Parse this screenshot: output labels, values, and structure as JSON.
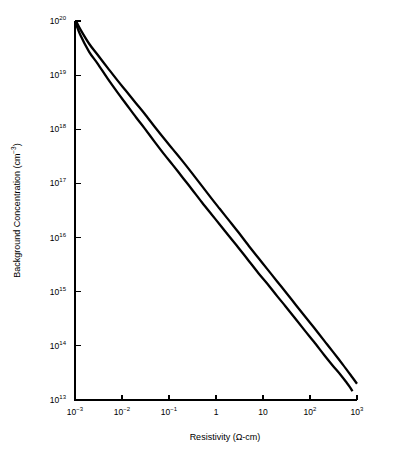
{
  "chart_data": {
    "type": "line",
    "title": "",
    "xlabel": "Resistivity (Ω-cm)",
    "ylabel": "Background Concentration (cm⁻³)",
    "xscale": "log",
    "yscale": "log",
    "xlim": [
      0.001,
      1000
    ],
    "ylim": [
      10000000000000.0,
      1e+20
    ],
    "grid": false,
    "legend": "none",
    "background_color": "#ffffff",
    "line_color": "#000000",
    "xticks": [
      {
        "value": 0.001,
        "mantissa": "10",
        "exponent": "−3",
        "label": "10⁻³"
      },
      {
        "value": 0.01,
        "mantissa": "10",
        "exponent": "−2",
        "label": "10⁻²"
      },
      {
        "value": 0.1,
        "mantissa": "10",
        "exponent": "−1",
        "label": "10⁻¹"
      },
      {
        "value": 1,
        "mantissa": "1",
        "exponent": "",
        "label": "1"
      },
      {
        "value": 10,
        "mantissa": "10",
        "exponent": "",
        "label": "10"
      },
      {
        "value": 100,
        "mantissa": "10",
        "exponent": "2",
        "label": "10²"
      },
      {
        "value": 1000,
        "mantissa": "10",
        "exponent": "3",
        "label": "10³"
      }
    ],
    "yticks": [
      {
        "value": 10000000000000.0,
        "mantissa": "10",
        "exponent": "13",
        "label": "10¹³"
      },
      {
        "value": 100000000000000.0,
        "mantissa": "10",
        "exponent": "14",
        "label": "10¹⁴"
      },
      {
        "value": 1000000000000000.0,
        "mantissa": "10",
        "exponent": "15",
        "label": "10¹⁵"
      },
      {
        "value": 1e+16,
        "mantissa": "10",
        "exponent": "16",
        "label": "10¹⁶"
      },
      {
        "value": 1e+17,
        "mantissa": "10",
        "exponent": "17",
        "label": "10¹⁷"
      },
      {
        "value": 1e+18,
        "mantissa": "10",
        "exponent": "18",
        "label": "10¹⁸"
      },
      {
        "value": 1e+19,
        "mantissa": "10",
        "exponent": "19",
        "label": "10¹⁹"
      },
      {
        "value": 1e+20,
        "mantissa": "10",
        "exponent": "20",
        "label": "10²⁰"
      }
    ],
    "series": [
      {
        "name": "upper-curve",
        "points": [
          [
            0.00105,
            1e+20
          ],
          [
            0.0013,
            7e+19
          ],
          [
            0.002,
            3.8e+19
          ],
          [
            0.003,
            2.4e+19
          ],
          [
            0.005,
            1.35e+19
          ],
          [
            0.008,
            8e+18
          ],
          [
            0.012,
            5.2e+18
          ],
          [
            0.02,
            3e+18
          ],
          [
            0.03,
            1.95e+18
          ],
          [
            0.05,
            1.1e+18
          ],
          [
            0.08,
            6.6e+17
          ],
          [
            0.12,
            4.3e+17
          ],
          [
            0.2,
            2.5e+17
          ],
          [
            0.3,
            1.6e+17
          ],
          [
            0.5,
            9e+16
          ],
          [
            0.8,
            5.3e+16
          ],
          [
            1.2,
            3.4e+16
          ],
          [
            2.0,
            1.95e+16
          ],
          [
            3.0,
            1.25e+16
          ],
          [
            5.0,
            7000000000000000.0
          ],
          [
            8.0,
            4200000000000000.0
          ],
          [
            12.0,
            2700000000000000.0
          ],
          [
            20.0,
            1550000000000000.0
          ],
          [
            30.0,
            1000000000000000.0
          ],
          [
            50.0,
            570000000000000.0
          ],
          [
            80.0,
            340000000000000.0
          ],
          [
            120.0,
            220000000000000.0
          ],
          [
            200.0,
            125000000000000.0
          ],
          [
            300.0,
            80000000000000.0
          ],
          [
            500.0,
            45000000000000.0
          ],
          [
            800.0,
            26000000000000.0
          ],
          [
            1000.0,
            20000000000000.0
          ]
        ]
      },
      {
        "name": "lower-curve",
        "points": [
          [
            0.001,
            1e+20
          ],
          [
            0.0013,
            5.5e+19
          ],
          [
            0.002,
            2.7e+19
          ],
          [
            0.003,
            1.65e+19
          ],
          [
            0.005,
            8.5e+18
          ],
          [
            0.008,
            4.8e+18
          ],
          [
            0.012,
            3e+18
          ],
          [
            0.02,
            1.65e+18
          ],
          [
            0.03,
            1.05e+18
          ],
          [
            0.05,
            5.8e+17
          ],
          [
            0.08,
            3.4e+17
          ],
          [
            0.12,
            2.2e+17
          ],
          [
            0.2,
            1.25e+17
          ],
          [
            0.3,
            8e+16
          ],
          [
            0.5,
            4.5e+16
          ],
          [
            0.8,
            2.7e+16
          ],
          [
            1.2,
            1.75e+16
          ],
          [
            2.0,
            1e+16
          ],
          [
            3.0,
            6500000000000000.0
          ],
          [
            5.0,
            3700000000000000.0
          ],
          [
            8.0,
            2200000000000000.0
          ],
          [
            12.0,
            1450000000000000.0
          ],
          [
            20.0,
            830000000000000.0
          ],
          [
            30.0,
            540000000000000.0
          ],
          [
            50.0,
            310000000000000.0
          ],
          [
            80.0,
            185000000000000.0
          ],
          [
            120.0,
            120000000000000.0
          ],
          [
            200.0,
            68000000000000.0
          ],
          [
            300.0,
            44000000000000.0
          ],
          [
            450.0,
            29000000000000.0
          ],
          [
            600.0,
            21000000000000.0
          ],
          [
            700.0,
            17500000000000.0
          ],
          [
            800.0,
            14500000000000.0
          ]
        ]
      }
    ]
  }
}
